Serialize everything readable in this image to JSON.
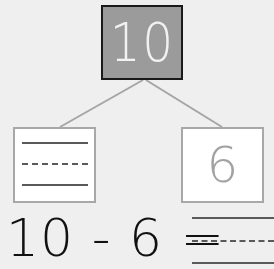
{
  "number_bond": {
    "whole": "10",
    "part_left": "",
    "part_right": "6"
  },
  "equation": {
    "text": "10 - 6 =",
    "answer": ""
  },
  "colors": {
    "background": "#efefef",
    "whole_fill": "#9b9b9b",
    "whole_border": "#1a1a1a",
    "whole_text": "#f2f2f2",
    "part_border": "#a8a8a8",
    "part_text": "#a3a3a3",
    "connector": "#a5a5a5",
    "equation_text": "#111111"
  }
}
